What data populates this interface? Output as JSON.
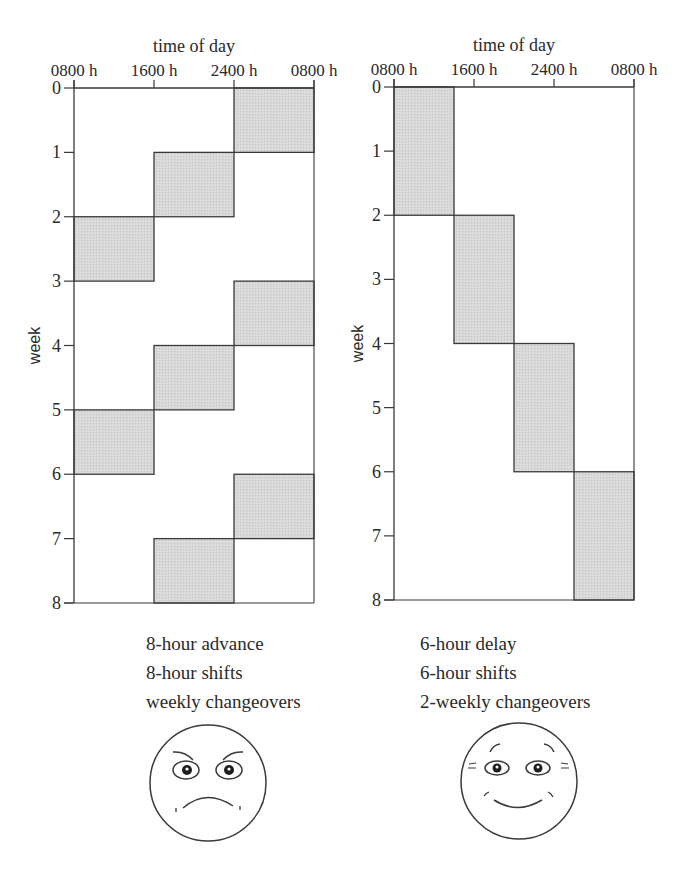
{
  "chart_data": [
    {
      "type": "gantt",
      "title": "8-hour advance rotation",
      "xlabel": "time of day",
      "ylabel": "week",
      "x_ticks": [
        "0800 h",
        "1600 h",
        "2400 h",
        "0800 h"
      ],
      "y_ticks": [
        0,
        1,
        2,
        3,
        4,
        5,
        6,
        7,
        8
      ],
      "xlim_hours": [
        0,
        24
      ],
      "ylim_weeks": [
        0,
        8
      ],
      "shift_length_hours": 8,
      "blocks": [
        {
          "week_start": 0,
          "week_end": 1,
          "hour_start": 16,
          "hour_end": 24,
          "label": "2400 h - 0800 h"
        },
        {
          "week_start": 1,
          "week_end": 2,
          "hour_start": 8,
          "hour_end": 16,
          "label": "1600 h - 2400 h"
        },
        {
          "week_start": 2,
          "week_end": 3,
          "hour_start": 0,
          "hour_end": 8,
          "label": "0800 h - 1600 h"
        },
        {
          "week_start": 3,
          "week_end": 4,
          "hour_start": 16,
          "hour_end": 24,
          "label": "2400 h - 0800 h"
        },
        {
          "week_start": 4,
          "week_end": 5,
          "hour_start": 8,
          "hour_end": 16,
          "label": "1600 h - 2400 h"
        },
        {
          "week_start": 5,
          "week_end": 6,
          "hour_start": 0,
          "hour_end": 8,
          "label": "0800 h - 1600 h"
        },
        {
          "week_start": 6,
          "week_end": 7,
          "hour_start": 16,
          "hour_end": 24,
          "label": "2400 h - 0800 h"
        },
        {
          "week_start": 7,
          "week_end": 8,
          "hour_start": 8,
          "hour_end": 16,
          "label": "1600 h - 2400 h"
        }
      ],
      "caption": [
        "8-hour advance",
        "8-hour shifts",
        "weekly changeovers"
      ],
      "face": "unhappy"
    },
    {
      "type": "gantt",
      "title": "6-hour delay rotation",
      "xlabel": "time of day",
      "ylabel": "week",
      "x_ticks": [
        "0800 h",
        "1600 h",
        "2400 h",
        "0800 h"
      ],
      "y_ticks": [
        0,
        1,
        2,
        3,
        4,
        5,
        6,
        7,
        8
      ],
      "xlim_hours": [
        0,
        24
      ],
      "ylim_weeks": [
        0,
        8
      ],
      "shift_length_hours": 6,
      "blocks": [
        {
          "week_start": 0,
          "week_end": 2,
          "hour_start": 0,
          "hour_end": 6,
          "label": "0800 h - 1400 h"
        },
        {
          "week_start": 2,
          "week_end": 4,
          "hour_start": 6,
          "hour_end": 12,
          "label": "1400 h - 2000 h"
        },
        {
          "week_start": 4,
          "week_end": 6,
          "hour_start": 12,
          "hour_end": 18,
          "label": "2000 h - 0200 h"
        },
        {
          "week_start": 6,
          "week_end": 8,
          "hour_start": 18,
          "hour_end": 24,
          "label": "0200 h - 0800 h"
        }
      ],
      "caption": [
        "6-hour delay",
        "6-hour shifts",
        "2-weekly changeovers"
      ],
      "face": "happy"
    }
  ],
  "style": {
    "block_fill": "#d6d6d6",
    "line_color": "#3a3a3a",
    "text_color": "#2a2a2a"
  }
}
